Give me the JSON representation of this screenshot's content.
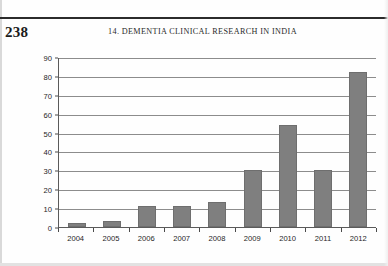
{
  "page": {
    "folio": "238",
    "running_head": "14.  DEMENTIA CLINICAL RESEARCH IN INDIA"
  },
  "chart_data": {
    "type": "bar",
    "title": "",
    "xlabel": "",
    "ylabel": "",
    "categories": [
      "2004",
      "2005",
      "2006",
      "2007",
      "2008",
      "2009",
      "2010",
      "2011",
      "2012"
    ],
    "values": [
      2,
      3,
      11,
      11,
      13,
      30,
      54,
      30,
      82
    ],
    "ylim": [
      0,
      90
    ],
    "ytick_step": 10,
    "yticks": [
      "0",
      "10",
      "20",
      "30",
      "40",
      "50",
      "60",
      "70",
      "80",
      "90"
    ],
    "grid": true,
    "legend": false,
    "bar_color": "#7f7f7f",
    "axis_color": "#5a5a5a",
    "gridline_color": "#8c8c8c"
  }
}
